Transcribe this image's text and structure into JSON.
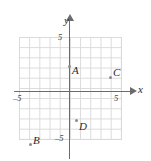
{
  "figure": {
    "title": "",
    "axis_labels": {
      "x": "x",
      "y": "y"
    },
    "tick_labels": {
      "x_negative": "–5",
      "x_positive": "5",
      "y_positive": "5",
      "y_negative": "–5"
    },
    "colors": {
      "grid": "#d9d9d9",
      "axis": "#6b6b6b",
      "point": "#8c8c8c",
      "text": "#2b2b2b",
      "background": "#ffffff"
    }
  },
  "chart_data": {
    "type": "scatter",
    "title": "",
    "xlabel": "x",
    "ylabel": "y",
    "xlim": [
      -5,
      5
    ],
    "ylim": [
      -5,
      5
    ],
    "xticks": [
      -5,
      5
    ],
    "yticks": [
      -5,
      5
    ],
    "grid": true,
    "grid_step": 1,
    "legend": "none",
    "points": [
      {
        "label": "A",
        "x": 0,
        "y": 3
      },
      {
        "label": "B",
        "x": -4,
        "y": -5
      },
      {
        "label": "C",
        "x": 4,
        "y": 1.5
      },
      {
        "label": "D",
        "x": 0.5,
        "y": -3
      }
    ]
  }
}
